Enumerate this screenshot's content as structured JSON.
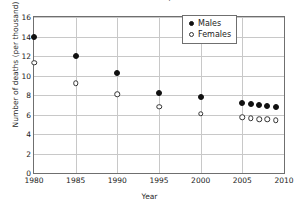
{
  "chart_data": {
    "type": "scatter",
    "title": "Infant mortality rate",
    "xlabel": "Year",
    "ylabel": "Number of deaths (per thousand)",
    "xlim": [
      1980,
      2010
    ],
    "ylim": [
      0,
      16
    ],
    "xticks": [
      "1980",
      "1985",
      "1990",
      "1995",
      "2000",
      "2005",
      "2010"
    ],
    "xtick_values": [
      1980,
      1985,
      1990,
      1995,
      2000,
      2005,
      2010
    ],
    "yticks": [
      "0",
      "2",
      "4",
      "6",
      "8",
      "10",
      "12",
      "14",
      "16"
    ],
    "ytick_values": [
      0,
      2,
      4,
      6,
      8,
      10,
      12,
      14,
      16
    ],
    "grid": true,
    "legend_position": "top-right",
    "series": [
      {
        "name": "Males",
        "marker": "filled-circle",
        "color": "#111111",
        "x": [
          1980,
          1985,
          1990,
          1995,
          2000,
          2005,
          2006,
          2007,
          2008,
          2009
        ],
        "values": [
          14.0,
          12.0,
          10.3,
          8.2,
          7.8,
          7.2,
          7.1,
          7.0,
          6.9,
          6.8
        ]
      },
      {
        "name": "Females",
        "marker": "open-circle",
        "color": "#333333",
        "x": [
          1980,
          1985,
          1990,
          1995,
          2000,
          2005,
          2006,
          2007,
          2008,
          2009
        ],
        "values": [
          11.3,
          9.2,
          8.1,
          6.8,
          6.1,
          5.7,
          5.6,
          5.5,
          5.5,
          5.4
        ]
      }
    ]
  },
  "legend": {
    "items": [
      {
        "label": "Males",
        "marker": "filled-circle"
      },
      {
        "label": "Females",
        "marker": "open-circle"
      }
    ]
  }
}
